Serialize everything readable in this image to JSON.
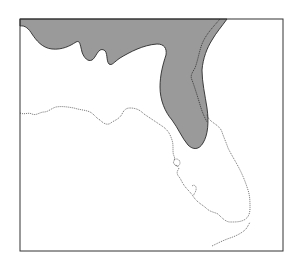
{
  "map": {
    "subject": "Florida and southeastern Georgia/Alabama range map",
    "frame": {
      "x": 20,
      "y": 19,
      "width": 263,
      "height": 232,
      "stroke": "#333333"
    },
    "range_fill": "#9a9a9a",
    "range_stroke": "#2a2a2a",
    "coastline_stroke": "#333333",
    "background": "#ffffff",
    "caption": "Shaded area indicates range"
  }
}
